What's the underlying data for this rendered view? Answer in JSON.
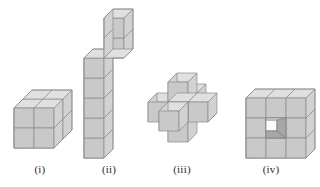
{
  "figure": {
    "background_color": "#ffffff",
    "stroke_color": "#7a7a7a",
    "palette": {
      "top_face": "#e0e0e0",
      "left_face": "#d2d2d2",
      "front_face": "#c9c9c9",
      "hole_light": "#fbfbfb",
      "hole_dark": "#a7a7a7",
      "outline": "#8a8a8a"
    },
    "projection": "oblique (depth offset up-right)",
    "captions": [
      {
        "key": "i",
        "label": "(i)"
      },
      {
        "key": "ii",
        "label": "(ii)"
      },
      {
        "key": "iii",
        "label": "(iii)"
      },
      {
        "key": "iv",
        "label": "(iv)"
      }
    ],
    "solids": [
      {
        "key": "i",
        "label": "(i)",
        "description": "2 by 2 by 2 block of unit cubes",
        "dimensions": "2 x 2 x 2",
        "cube_count": 8
      },
      {
        "key": "ii",
        "label": "(ii)",
        "description": "Tall L shaped column: vertical stack of 5 cubes with a 2 cube arm stepping up and back at the top",
        "dimensions": "L-shape, height 7 units",
        "cube_count": 7
      },
      {
        "key": "iii",
        "label": "(iii)",
        "description": "Three dimensional plus or cross: a centre cube with one cube attached on each of its six faces",
        "dimensions": "3 x 3 x 3 cross",
        "cube_count": 7
      },
      {
        "key": "iv",
        "label": "(iv)",
        "description": "3 by 3 by 3 cube with the centre cube of the front face removed leaving a square hole",
        "dimensions": "3 x 3 x 3",
        "cube_count": 26
      }
    ]
  }
}
